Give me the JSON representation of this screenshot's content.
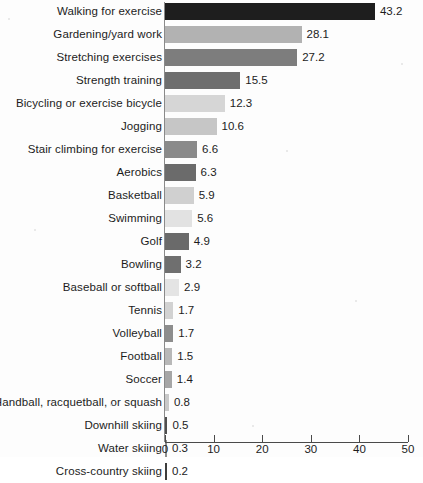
{
  "chart_data": {
    "type": "bar",
    "orientation": "horizontal",
    "title": "",
    "xlabel": "",
    "ylabel": "",
    "xlim": [
      0,
      50
    ],
    "xticks": [
      0,
      10,
      20,
      30,
      40,
      50
    ],
    "xtick_labels": [
      "0",
      "10",
      "20",
      "30",
      "40",
      "50"
    ],
    "grid": false,
    "legend": null,
    "value_labels_shown": true,
    "categories": [
      "Walking for exercise",
      "Gardening/yard work",
      "Stretching exercises",
      "Strength training",
      "Bicycling or exercise bicycle",
      "Jogging",
      "Stair climbing for exercise",
      "Aerobics",
      "Basketball",
      "Swimming",
      "Golf",
      "Bowling",
      "Baseball or softball",
      "Tennis",
      "Volleyball",
      "Football",
      "Soccer",
      "Handball, racquetball, or squash",
      "Downhill skiing",
      "Water skiing",
      "Cross-country skiing"
    ],
    "values": [
      43.2,
      28.1,
      27.2,
      15.5,
      12.3,
      10.6,
      6.6,
      6.3,
      5.9,
      5.6,
      4.9,
      3.2,
      2.9,
      1.7,
      1.7,
      1.5,
      1.4,
      0.8,
      0.5,
      0.3,
      0.2
    ],
    "value_labels": [
      "43.2",
      "28.1",
      "27.2",
      "15.5",
      "12.3",
      "10.6",
      "6.6",
      "6.3",
      "5.9",
      "5.6",
      "4.9",
      "3.2",
      "2.9",
      "1.7",
      "1.7",
      "1.5",
      "1.4",
      "0.8",
      "0.5",
      "0.3",
      "0.2"
    ],
    "bar_colors": [
      "#1e1e1e",
      "#b2b2b2",
      "#7d7d7d",
      "#6e6e6e",
      "#d6d6d6",
      "#c6c6c6",
      "#8a8a8a",
      "#6b6b6b",
      "#d0d0d0",
      "#e2e2e2",
      "#6a6a6a",
      "#6f6f6f",
      "#e4e4e4",
      "#d2d2d2",
      "#8d8d8d",
      "#b8b8b8",
      "#a6a6a6",
      "#c9c9c9",
      "#4f4f4f",
      "#8f8f8f",
      "#3d3d3d"
    ]
  },
  "axis": {
    "tick_color": "#4a4a4a"
  }
}
